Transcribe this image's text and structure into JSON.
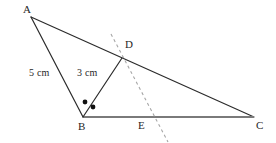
{
  "figure": {
    "width": 276,
    "height": 143,
    "background_color": "#ffffff",
    "stroke_color": "#2b2b2b",
    "base_line_color": "#7a7a7a",
    "dashed_line_color": "#a6a6a6",
    "dot_color": "#111111"
  },
  "vertices": {
    "A": {
      "label": "A",
      "x": 31,
      "y": 17,
      "label_x": 23,
      "label_y": 4
    },
    "B": {
      "label": "B",
      "x": 83,
      "y": 117,
      "label_x": 78,
      "label_y": 121
    },
    "C": {
      "label": "C",
      "x": 254,
      "y": 117,
      "label_x": 256,
      "label_y": 120
    },
    "D": {
      "label": "D",
      "x": 122,
      "y": 58,
      "label_x": 125,
      "label_y": 39
    },
    "E": {
      "label": "E",
      "x": 143,
      "y": 117,
      "label_x": 138,
      "label_y": 120
    }
  },
  "segments": [
    {
      "name": "side-ab",
      "from": "A",
      "to": "B",
      "style": "solid",
      "color": "#2b2b2b",
      "width": 1.2
    },
    {
      "name": "side-ac",
      "from": "A",
      "to": "C",
      "style": "solid",
      "color": "#2b2b2b",
      "width": 1.2
    },
    {
      "name": "side-bc",
      "from": "B",
      "to": "C",
      "style": "solid",
      "color": "#7a7a7a",
      "width": 2.0
    },
    {
      "name": "cevian-bd",
      "from": "B",
      "to": "D",
      "style": "solid",
      "color": "#2b2b2b",
      "width": 1.2
    }
  ],
  "dashed_line": {
    "name": "dashed-construction-line",
    "x1": 111,
    "y1": 34,
    "x2": 168,
    "y2": 142,
    "color": "#a6a6a6",
    "dash_pattern": "3,3",
    "width": 1.1
  },
  "angle_marks": {
    "description": "Two dots marking congruent angles at vertex B",
    "dots": [
      {
        "name": "angle-dot-abd",
        "x": 85,
        "y": 102,
        "r": 2.4
      },
      {
        "name": "angle-dot-dbc",
        "x": 93,
        "y": 107,
        "r": 2.4
      }
    ]
  },
  "measurements": [
    {
      "name": "length-ab",
      "text": "5 cm",
      "x": 29,
      "y": 68,
      "refers_to": "AB"
    },
    {
      "name": "length-bd",
      "text": "3 cm",
      "x": 77,
      "y": 68,
      "refers_to": "BD"
    }
  ]
}
